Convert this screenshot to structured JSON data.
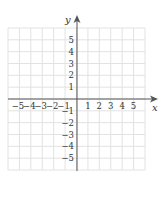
{
  "chart_data": {
    "type": "scatter",
    "title": "",
    "xlabel": "x",
    "ylabel": "y",
    "xlim": [
      -6,
      6
    ],
    "ylim": [
      -6,
      6
    ],
    "grid": true,
    "x_ticks": [
      -5,
      -4,
      -3,
      -2,
      -1,
      1,
      2,
      3,
      4,
      5
    ],
    "y_ticks": [
      5,
      4,
      3,
      2,
      1,
      -1,
      -2,
      -3,
      -4,
      -5
    ],
    "x_tick_labels": [
      "−5",
      "−4",
      "−3",
      "−2",
      "−1",
      "1",
      "2",
      "3",
      "4",
      "5"
    ],
    "y_tick_labels": [
      "5",
      "4",
      "3",
      "2",
      "1",
      "−1",
      "−2",
      "−3",
      "−4",
      "−5"
    ],
    "series": []
  },
  "axes": {
    "x_label": "x",
    "y_label": "y"
  },
  "colors": {
    "grid": "#e2e2e2",
    "axis": "#555555",
    "text": "#333333"
  }
}
